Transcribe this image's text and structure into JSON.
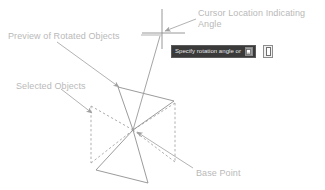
{
  "diagram": {
    "colors": {
      "label_text": "#b9b9b9",
      "geometry_line": "#8f8f8f",
      "dashed_line": "#a8a8a8",
      "leader_line": "#a9a9a9",
      "prompt_background": "#3a3a3a",
      "prompt_text": "#e6e6e6"
    }
  },
  "labels": {
    "cursor": "Cursor Location Indicating\nAngle",
    "preview": "Preview of Rotated Objects",
    "selected": "Selected Objects",
    "base_point": "Base Point"
  },
  "prompt": {
    "text": "Specify rotation angle or",
    "inline_button_name": "expand-options-button",
    "outer_button_name": "dynamic-input-toggle-button"
  },
  "geometry": {
    "base_point": {
      "x": 133,
      "y": 130
    },
    "cursor": {
      "x": 162,
      "y": 34
    },
    "selected_objects_bbox": {
      "x1": 91,
      "y1": 105,
      "x2": 175,
      "y2": 163
    }
  }
}
